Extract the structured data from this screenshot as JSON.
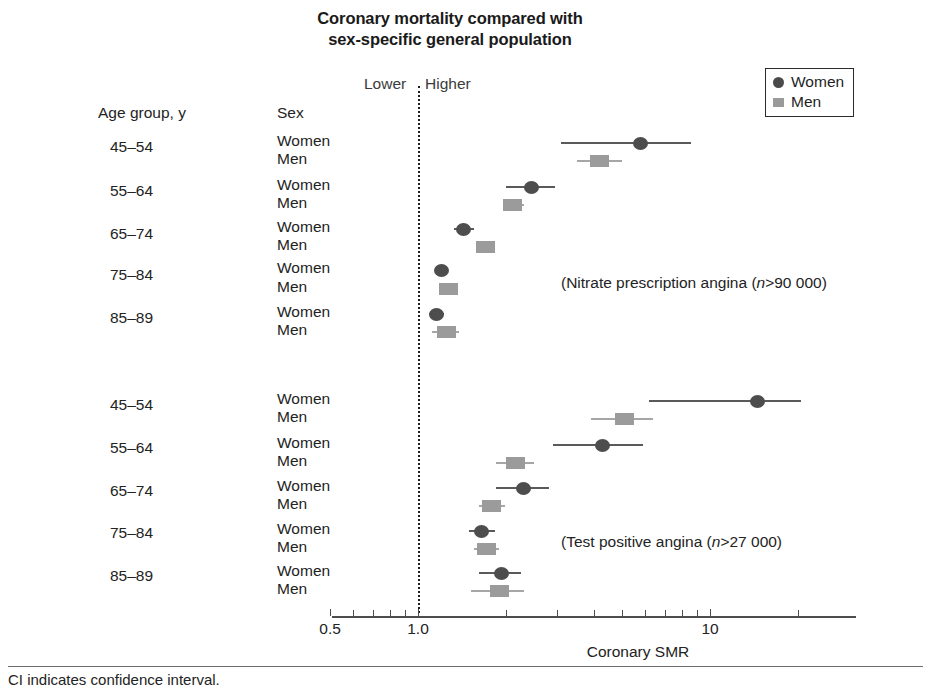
{
  "title": {
    "line1": "Coronary mortality compared with",
    "line2": "sex-specific general population"
  },
  "direction": {
    "lower": "Lower",
    "higher": "Higher"
  },
  "legend": {
    "items": [
      {
        "label": "Women",
        "marker": "circle",
        "color": "#4a4a4a"
      },
      {
        "label": "Men",
        "marker": "square",
        "color": "#9a9a9a"
      }
    ]
  },
  "columns": {
    "age": "Age group, y",
    "sex": "Sex"
  },
  "annotations": {
    "group1": {
      "prefix": "(Nitrate prescription angina (",
      "italic": "n",
      "suffix": ">90 000)"
    },
    "group2": {
      "prefix": "(Test positive angina (",
      "italic": "n",
      "suffix": ">27 000)"
    }
  },
  "axis": {
    "title": "Coronary SMR",
    "tick_labels": [
      "0.5",
      "1.0",
      "10"
    ],
    "tick_values": [
      0.5,
      1.0,
      10
    ],
    "range": [
      0.5,
      22
    ],
    "scale": "log"
  },
  "footer": "CI indicates confidence interval.",
  "chart_data": {
    "type": "scatter",
    "subtype": "forest-plot",
    "title": "Coronary mortality compared with sex-specific general population",
    "xlabel": "Coronary SMR",
    "ylabel": "",
    "xscale": "log",
    "xlim": [
      0.5,
      22
    ],
    "xticks": [
      0.5,
      1.0,
      10
    ],
    "xticklabels": [
      "0.5",
      "1.0",
      "10"
    ],
    "reference_line": 1.0,
    "grid": false,
    "legend_position": "top-right",
    "series": [
      {
        "name": "Women",
        "marker": "circle",
        "color": "#4d4d4d"
      },
      {
        "name": "Men",
        "marker": "square",
        "color": "#9b9b9b"
      }
    ],
    "groups": [
      {
        "name": "Nitrate prescription angina (n>90 000)",
        "rows": [
          {
            "age": "45–54",
            "sex": "Women",
            "smr": 5.8,
            "ci_low": 3.1,
            "ci_high": 8.6
          },
          {
            "age": "45–54",
            "sex": "Men",
            "smr": 4.2,
            "ci_low": 3.5,
            "ci_high": 5.0
          },
          {
            "age": "55–64",
            "sex": "Women",
            "smr": 2.45,
            "ci_low": 2.0,
            "ci_high": 2.95
          },
          {
            "age": "55–64",
            "sex": "Men",
            "smr": 2.1,
            "ci_low": 1.95,
            "ci_high": 2.3
          },
          {
            "age": "65–74",
            "sex": "Women",
            "smr": 1.43,
            "ci_low": 1.33,
            "ci_high": 1.55
          },
          {
            "age": "65–74",
            "sex": "Men",
            "smr": 1.7,
            "ci_low": 1.6,
            "ci_high": 1.82
          },
          {
            "age": "75–84",
            "sex": "Women",
            "smr": 1.2,
            "ci_low": 1.15,
            "ci_high": 1.26
          },
          {
            "age": "75–84",
            "sex": "Men",
            "smr": 1.27,
            "ci_low": 1.2,
            "ci_high": 1.35
          },
          {
            "age": "85–89",
            "sex": "Women",
            "smr": 1.16,
            "ci_low": 1.09,
            "ci_high": 1.23
          },
          {
            "age": "85–89",
            "sex": "Men",
            "smr": 1.25,
            "ci_low": 1.12,
            "ci_high": 1.38
          }
        ]
      },
      {
        "name": "Test positive angina (n>27 000)",
        "rows": [
          {
            "age": "45–54",
            "sex": "Women",
            "smr": 14.5,
            "ci_low": 6.2,
            "ci_high": 20.5
          },
          {
            "age": "45–54",
            "sex": "Men",
            "smr": 5.1,
            "ci_low": 3.9,
            "ci_high": 6.4
          },
          {
            "age": "55–64",
            "sex": "Women",
            "smr": 4.3,
            "ci_low": 2.9,
            "ci_high": 5.9
          },
          {
            "age": "55–64",
            "sex": "Men",
            "smr": 2.15,
            "ci_low": 1.85,
            "ci_high": 2.5
          },
          {
            "age": "65–74",
            "sex": "Women",
            "smr": 2.3,
            "ci_low": 1.85,
            "ci_high": 2.8
          },
          {
            "age": "65–74",
            "sex": "Men",
            "smr": 1.78,
            "ci_low": 1.62,
            "ci_high": 1.98
          },
          {
            "age": "75–84",
            "sex": "Women",
            "smr": 1.65,
            "ci_low": 1.5,
            "ci_high": 1.83
          },
          {
            "age": "75–84",
            "sex": "Men",
            "smr": 1.72,
            "ci_low": 1.55,
            "ci_high": 1.9
          },
          {
            "age": "85–89",
            "sex": "Women",
            "smr": 1.93,
            "ci_low": 1.62,
            "ci_high": 2.25
          },
          {
            "age": "85–89",
            "sex": "Men",
            "smr": 1.9,
            "ci_low": 1.52,
            "ci_high": 2.3
          }
        ]
      }
    ]
  },
  "layout": {
    "x_pixel_at_half": 332,
    "x_pixel_at_one": 418,
    "x_pixel_at_ten": 710,
    "group_row_tops": [
      [
        143,
        161,
        187,
        205,
        229,
        247,
        270,
        289,
        314,
        332
      ],
      [
        401,
        419,
        445,
        463,
        488,
        506,
        531,
        549,
        573,
        591
      ]
    ],
    "age_label_tops": [
      138,
      182,
      225,
      266,
      309,
      396,
      439,
      482,
      524,
      567
    ],
    "minor_ticks": [
      2,
      3,
      4,
      5,
      6,
      7,
      8,
      9,
      20
    ]
  }
}
